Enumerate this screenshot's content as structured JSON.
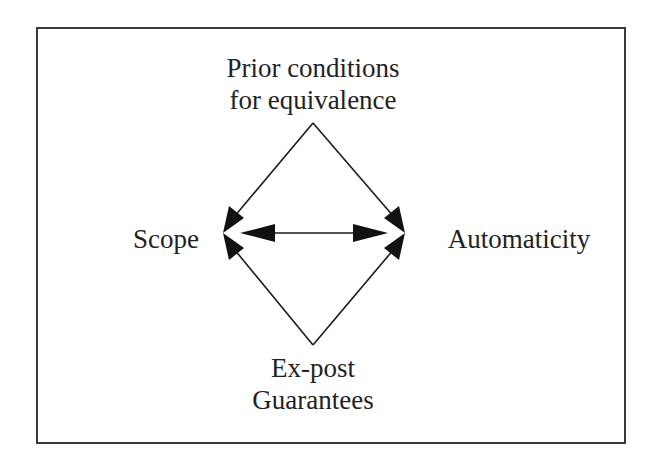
{
  "diagram": {
    "nodes": {
      "top": {
        "line1": "Prior conditions",
        "line2": "for equivalence"
      },
      "left": {
        "label": "Scope"
      },
      "right": {
        "label": "Automaticity"
      },
      "bottom": {
        "line1": "Ex-post",
        "line2": "Guarantees"
      }
    },
    "edges": [
      {
        "from": "Prior conditions for equivalence",
        "to": "Scope",
        "type": "directed"
      },
      {
        "from": "Prior conditions for equivalence",
        "to": "Automaticity",
        "type": "directed"
      },
      {
        "from": "Ex-post Guarantees",
        "to": "Scope",
        "type": "directed"
      },
      {
        "from": "Ex-post Guarantees",
        "to": "Automaticity",
        "type": "directed"
      },
      {
        "from": "Scope",
        "to": "Automaticity",
        "type": "bidirectional"
      }
    ],
    "colors": {
      "stroke": "#1a1a1a",
      "border": "#3a3a3a",
      "text": "#222222",
      "background": "#ffffff"
    }
  }
}
